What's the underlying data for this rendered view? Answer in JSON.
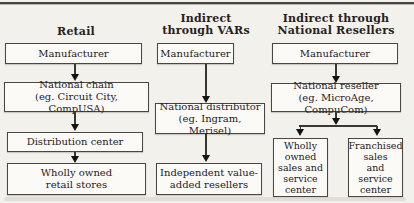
{
  "diagram": {
    "title_note": "Distribution channel structures",
    "colors": {
      "ink": "#26211d",
      "line": "#3a3632",
      "box_background": "#fbfaf7",
      "page_background": "#f3f1ec"
    },
    "columns": [
      {
        "heading": "Retail",
        "boxes": [
          {
            "label": "Manufacturer"
          },
          {
            "label": "National chain\n(eg. Circuit City, CompUSA)"
          },
          {
            "label": "Distribution center"
          },
          {
            "label": "Wholly owned\nretail stores"
          }
        ]
      },
      {
        "heading": "Indirect\nthrough VARs",
        "boxes": [
          {
            "label": "Manufacturer"
          },
          {
            "label": "National distributor\n(eg. Ingram, Merisel)"
          },
          {
            "label": "Independent value-\nadded resellers"
          }
        ]
      },
      {
        "heading": "Indirect through\nNational Resellers",
        "boxes": [
          {
            "label": "Manufacturer"
          },
          {
            "label": "National reseller\n(eg. MicroAge, CompuCom)"
          },
          {
            "label": "Wholly\nowned\nsales and\nservice\ncenter"
          },
          {
            "label": "Franchised\nsales\nand\nservice\ncenter"
          }
        ]
      }
    ]
  }
}
